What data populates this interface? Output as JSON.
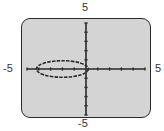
{
  "chart_data": {
    "type": "line",
    "title": "",
    "xlabel": "",
    "ylabel": "",
    "xlim": [
      -5,
      5
    ],
    "ylim": [
      -5,
      5
    ],
    "tick_labels": {
      "top": "5",
      "bottom": "-5",
      "left": "-5",
      "right": "5"
    },
    "x_tick_step": 1,
    "y_tick_step": 1,
    "grid": false,
    "series": [
      {
        "name": "ellipse",
        "shape": "ellipse",
        "center": [
          -2,
          0
        ],
        "semi_axis_x": 2.2,
        "semi_axis_y": 0.9,
        "x_range": [
          -4.2,
          0.2
        ],
        "y_range": [
          -0.9,
          0.9
        ]
      }
    ]
  },
  "colors": {
    "screen": "#d4d4d4",
    "ink": "#2a2a2a",
    "label": "#333333"
  }
}
